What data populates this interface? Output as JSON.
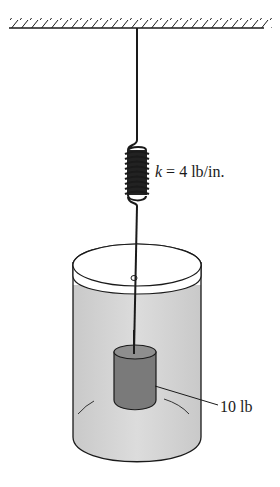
{
  "figure": {
    "spring_label": {
      "symbol": "k",
      "equals": " = 4 lb/in.",
      "value": 4,
      "unit": "lb/in."
    },
    "weight_label": {
      "text": "10 lb",
      "value": 10,
      "unit": "lb"
    },
    "colors": {
      "line": "#1a1a1a",
      "liquid": "#d6d6d6",
      "weight": "#7a7a7a",
      "weight_top": "#8e8e8e"
    }
  }
}
